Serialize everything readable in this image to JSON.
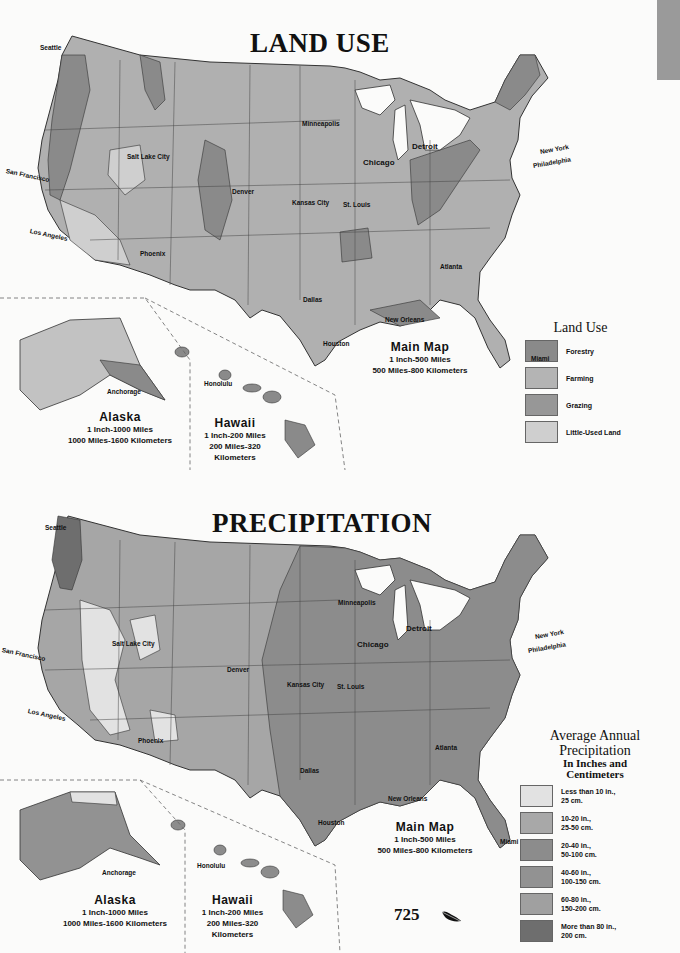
{
  "land_use": {
    "title": "LAND USE",
    "cities": [
      {
        "name": "Seattle",
        "x": 40,
        "y": 44
      },
      {
        "name": "Minneapolis",
        "x": 302,
        "y": 120
      },
      {
        "name": "Salt Lake City",
        "x": 127,
        "y": 153
      },
      {
        "name": "Detroit",
        "x": 412,
        "y": 142
      },
      {
        "name": "Chicago",
        "x": 363,
        "y": 158
      },
      {
        "name": "New York",
        "x": 540,
        "y": 148
      },
      {
        "name": "Philadelphia",
        "x": 533,
        "y": 162
      },
      {
        "name": "San Francisco",
        "x": 6,
        "y": 167
      },
      {
        "name": "Denver",
        "x": 232,
        "y": 188
      },
      {
        "name": "Kansas City",
        "x": 292,
        "y": 199
      },
      {
        "name": "St. Louis",
        "x": 343,
        "y": 201
      },
      {
        "name": "Los Angeles",
        "x": 30,
        "y": 227
      },
      {
        "name": "Phoenix",
        "x": 140,
        "y": 250
      },
      {
        "name": "Atlanta",
        "x": 440,
        "y": 263
      },
      {
        "name": "Dallas",
        "x": 303,
        "y": 296
      },
      {
        "name": "New Orleans",
        "x": 385,
        "y": 316
      },
      {
        "name": "Houston",
        "x": 323,
        "y": 340
      },
      {
        "name": "Miami",
        "x": 531,
        "y": 355
      },
      {
        "name": "Anchorage",
        "x": 107,
        "y": 388
      },
      {
        "name": "Honolulu",
        "x": 204,
        "y": 380
      }
    ],
    "main_map": {
      "name": "Main Map",
      "scale": "1 Inch-500 Miles",
      "conversion": "500 Miles-800 Kilometers"
    },
    "alaska": {
      "name": "Alaska",
      "scale": "1 Inch-1000 Miles",
      "conversion": "1000 Miles-1600 Kilometers"
    },
    "hawaii": {
      "name": "Hawaii",
      "scale": "1 Inch-200 Miles",
      "conversion_1": "200 Miles-320",
      "conversion_2": "Kilometers"
    },
    "legend": {
      "title": "Land Use",
      "items": [
        {
          "label": "Forestry",
          "color": "#8a8a8a"
        },
        {
          "label": "Farming",
          "color": "#b4b4b4"
        },
        {
          "label": "Grazing",
          "color": "#979797"
        },
        {
          "label": "Little-Used Land",
          "color": "#cfcfcf"
        }
      ]
    }
  },
  "precipitation": {
    "title": "PRECIPITATION",
    "cities": [
      {
        "name": "Seattle",
        "x": 45,
        "y": 524
      },
      {
        "name": "Minneapolis",
        "x": 338,
        "y": 599
      },
      {
        "name": "Salt Lake City",
        "x": 112,
        "y": 640
      },
      {
        "name": "Detroit",
        "x": 406,
        "y": 624
      },
      {
        "name": "Chicago",
        "x": 357,
        "y": 640
      },
      {
        "name": "New York",
        "x": 535,
        "y": 633
      },
      {
        "name": "Philadelphia",
        "x": 528,
        "y": 647
      },
      {
        "name": "San Francisco",
        "x": 2,
        "y": 646
      },
      {
        "name": "Denver",
        "x": 227,
        "y": 666
      },
      {
        "name": "Kansas City",
        "x": 287,
        "y": 681
      },
      {
        "name": "St. Louis",
        "x": 337,
        "y": 683
      },
      {
        "name": "Los Angeles",
        "x": 28,
        "y": 707
      },
      {
        "name": "Phoenix",
        "x": 138,
        "y": 737
      },
      {
        "name": "Atlanta",
        "x": 435,
        "y": 744
      },
      {
        "name": "Dallas",
        "x": 300,
        "y": 767
      },
      {
        "name": "New Orleans",
        "x": 388,
        "y": 795
      },
      {
        "name": "Houston",
        "x": 318,
        "y": 819
      },
      {
        "name": "Miami",
        "x": 500,
        "y": 838
      },
      {
        "name": "Anchorage",
        "x": 102,
        "y": 869
      },
      {
        "name": "Honolulu",
        "x": 197,
        "y": 862
      }
    ],
    "main_map": {
      "name": "Main Map",
      "scale": "1 Inch-500 Miles",
      "conversion": "500 Miles-800 Kilometers"
    },
    "alaska": {
      "name": "Alaska",
      "scale": "1 Inch-1000 Miles",
      "conversion": "1000 Miles-1600 Kilometers"
    },
    "hawaii": {
      "name": "Hawaii",
      "scale": "1 Inch-200 Miles",
      "conversion_1": "200 Miles-320",
      "conversion_2": "Kilometers"
    },
    "legend": {
      "title_1": "Average Annual",
      "title_2": "Precipitation",
      "subtitle_1": "In Inches and",
      "subtitle_2": "Centimeters",
      "items": [
        {
          "label": "Less than 10 in.,\n25 cm.",
          "color": "#e2e2e2"
        },
        {
          "label": "10-20 in.,\n25-50 cm.",
          "color": "#a8a8a8"
        },
        {
          "label": "20-40 in.,\n50-100 cm.",
          "color": "#8c8c8c"
        },
        {
          "label": "40-60 in.,\n100-150 cm.",
          "color": "#929292"
        },
        {
          "label": "60-80 in.,\n150-200 cm.",
          "color": "#a0a0a0"
        },
        {
          "label": "More than 80 in.,\n200 cm.",
          "color": "#6e6e6e"
        }
      ]
    }
  },
  "page_number": "725"
}
